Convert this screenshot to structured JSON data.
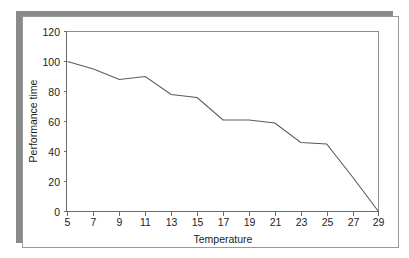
{
  "figure": {
    "background_color": "#ffffff",
    "card_color": "#ffffff",
    "shadow_color": "#8a8a8a",
    "border_color": "#9a9a9a",
    "line_color": "#5a5a5a",
    "axis_color": "#6b6b6b",
    "text_color": "#1c1c1c"
  },
  "chart_data": {
    "type": "line",
    "title": "",
    "xlabel": "Temperature",
    "ylabel": "Performance time",
    "xlim": [
      5,
      29
    ],
    "ylim": [
      0,
      120
    ],
    "xticks": [
      5,
      7,
      9,
      11,
      13,
      15,
      17,
      19,
      21,
      23,
      25,
      27,
      29
    ],
    "xtick_labels": [
      "5",
      "7",
      "9",
      "11",
      "13",
      "15",
      "17",
      "19",
      "21",
      "23",
      "25",
      "27",
      "29"
    ],
    "yticks": [
      0,
      20,
      40,
      60,
      80,
      100,
      120
    ],
    "ytick_labels": [
      "0",
      "20",
      "40",
      "60",
      "80",
      "100",
      "120"
    ],
    "grid": false,
    "legend": false,
    "x": [
      5,
      7,
      9,
      11,
      13,
      15,
      17,
      19,
      21,
      23,
      25,
      27,
      29
    ],
    "values": [
      100,
      95,
      88,
      90,
      78,
      76,
      61,
      61,
      59,
      46,
      45,
      23,
      0
    ],
    "series": [
      {
        "name": "Performance time",
        "x": [
          5,
          7,
          9,
          11,
          13,
          15,
          17,
          19,
          21,
          23,
          25,
          27,
          29
        ],
        "values": [
          100,
          95,
          88,
          90,
          78,
          76,
          61,
          61,
          59,
          46,
          45,
          23,
          0
        ]
      }
    ]
  }
}
